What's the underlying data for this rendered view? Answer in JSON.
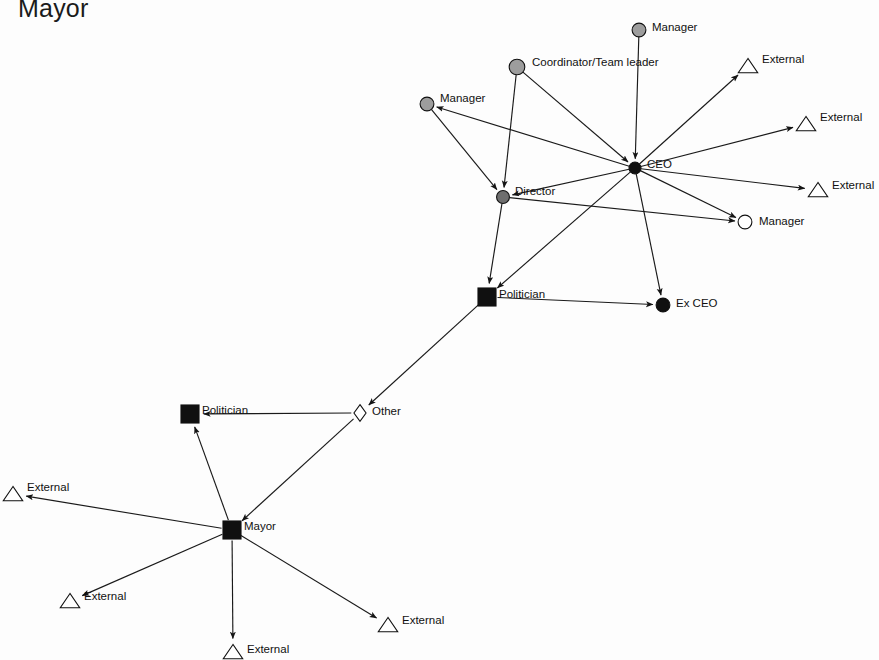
{
  "title": "Mayor",
  "diagram": {
    "type": "social-network-graph",
    "width": 879,
    "height": 660,
    "background_color": "#fdfdfd",
    "edge_color": "#1a1a1a",
    "label_color": "#111111",
    "shape_legend": {
      "circle-gray": "#9d9d9d",
      "circle-dark-gray": "#6e6e6e",
      "circle-black": "#101010",
      "circle-white": "#ffffff",
      "square-black": "#101010",
      "triangle-white": "#ffffff",
      "diamond-white": "#ffffff"
    },
    "nodes": [
      {
        "id": "manager_top",
        "label": "Manager",
        "shape": "circle",
        "fill": "#9d9d9d",
        "x": 639,
        "y": 30,
        "size": 15,
        "label_dx": 13,
        "label_dy": -2
      },
      {
        "id": "coordinator",
        "label": "Coordinator/Team leader",
        "shape": "circle",
        "fill": "#9d9d9d",
        "x": 517,
        "y": 67,
        "size": 17,
        "label_dx": 15,
        "label_dy": -4
      },
      {
        "id": "manager_left",
        "label": "Manager",
        "shape": "circle",
        "fill": "#9d9d9d",
        "x": 427,
        "y": 104,
        "size": 15,
        "label_dx": 13,
        "label_dy": -5
      },
      {
        "id": "ceo",
        "label": "CEO",
        "shape": "circle",
        "fill": "#101010",
        "x": 635,
        "y": 168,
        "size": 13,
        "label_dx": 12,
        "label_dy": -3
      },
      {
        "id": "director",
        "label": "Director",
        "shape": "circle",
        "fill": "#6e6e6e",
        "x": 503,
        "y": 197,
        "size": 14,
        "label_dx": 12,
        "label_dy": -5
      },
      {
        "id": "manager_right",
        "label": "Manager",
        "shape": "circle",
        "fill": "#ffffff",
        "x": 745,
        "y": 222,
        "size": 15,
        "label_dx": 14,
        "label_dy": 0
      },
      {
        "id": "external_r1",
        "label": "External",
        "shape": "triangle",
        "fill": "#ffffff",
        "x": 748,
        "y": 66,
        "size": 17,
        "label_dx": 14,
        "label_dy": -6
      },
      {
        "id": "external_r2",
        "label": "External",
        "shape": "triangle",
        "fill": "#ffffff",
        "x": 806,
        "y": 124,
        "size": 17,
        "label_dx": 14,
        "label_dy": -6
      },
      {
        "id": "external_r3",
        "label": "External",
        "shape": "triangle",
        "fill": "#ffffff",
        "x": 818,
        "y": 190,
        "size": 17,
        "label_dx": 14,
        "label_dy": -4
      },
      {
        "id": "politician_upper",
        "label": "Politician",
        "shape": "square",
        "fill": "#101010",
        "x": 487,
        "y": 297,
        "size": 17,
        "label_dx": 12,
        "label_dy": -2
      },
      {
        "id": "ex_ceo",
        "label": "Ex CEO",
        "shape": "circle",
        "fill": "#101010",
        "x": 663,
        "y": 305,
        "size": 15,
        "label_dx": 13,
        "label_dy": -1
      },
      {
        "id": "other",
        "label": "Other",
        "shape": "diamond",
        "fill": "#ffffff",
        "x": 360,
        "y": 413,
        "size": 15,
        "label_dx": 12,
        "label_dy": -1
      },
      {
        "id": "politician_lower",
        "label": "Politician",
        "shape": "square",
        "fill": "#101010",
        "x": 190,
        "y": 414,
        "size": 17,
        "label_dx": 12,
        "label_dy": -3
      },
      {
        "id": "mayor",
        "label": "Mayor",
        "shape": "square",
        "fill": "#101010",
        "x": 232,
        "y": 530,
        "size": 17,
        "label_dx": 12,
        "label_dy": -3
      },
      {
        "id": "external_l1",
        "label": "External",
        "shape": "triangle",
        "fill": "#ffffff",
        "x": 13,
        "y": 494,
        "size": 17,
        "label_dx": 14,
        "label_dy": -6
      },
      {
        "id": "external_l2",
        "label": "External",
        "shape": "triangle",
        "fill": "#ffffff",
        "x": 70,
        "y": 601,
        "size": 17,
        "label_dx": 14,
        "label_dy": -4
      },
      {
        "id": "external_b1",
        "label": "External",
        "shape": "triangle",
        "fill": "#ffffff",
        "x": 233,
        "y": 652,
        "size": 17,
        "label_dx": 14,
        "label_dy": -2
      },
      {
        "id": "external_b2",
        "label": "External",
        "shape": "triangle",
        "fill": "#ffffff",
        "x": 388,
        "y": 625,
        "size": 17,
        "label_dx": 14,
        "label_dy": -4
      }
    ],
    "edges": [
      {
        "from": "manager_top",
        "to": "ceo",
        "arrow": "to"
      },
      {
        "from": "coordinator",
        "to": "ceo",
        "arrow": "to"
      },
      {
        "from": "coordinator",
        "to": "director",
        "arrow": "to"
      },
      {
        "from": "manager_left",
        "to": "director",
        "arrow": "to"
      },
      {
        "from": "ceo",
        "to": "manager_left",
        "arrow": "to"
      },
      {
        "from": "ceo",
        "to": "director",
        "arrow": "to"
      },
      {
        "from": "ceo",
        "to": "external_r1",
        "arrow": "to"
      },
      {
        "from": "ceo",
        "to": "external_r2",
        "arrow": "to"
      },
      {
        "from": "ceo",
        "to": "external_r3",
        "arrow": "to"
      },
      {
        "from": "ceo",
        "to": "manager_right",
        "arrow": "to"
      },
      {
        "from": "director",
        "to": "manager_right",
        "arrow": "to"
      },
      {
        "from": "ceo",
        "to": "politician_upper",
        "arrow": "to"
      },
      {
        "from": "ceo",
        "to": "ex_ceo",
        "arrow": "to"
      },
      {
        "from": "director",
        "to": "politician_upper",
        "arrow": "to"
      },
      {
        "from": "politician_upper",
        "to": "ex_ceo",
        "arrow": "to"
      },
      {
        "from": "politician_upper",
        "to": "other",
        "arrow": "to"
      },
      {
        "from": "other",
        "to": "politician_lower",
        "arrow": "to"
      },
      {
        "from": "other",
        "to": "mayor",
        "arrow": "to"
      },
      {
        "from": "mayor",
        "to": "politician_lower",
        "arrow": "to"
      },
      {
        "from": "mayor",
        "to": "external_l1",
        "arrow": "to"
      },
      {
        "from": "mayor",
        "to": "external_l2",
        "arrow": "to"
      },
      {
        "from": "mayor",
        "to": "external_b1",
        "arrow": "to"
      },
      {
        "from": "mayor",
        "to": "external_b2",
        "arrow": "to"
      }
    ]
  }
}
